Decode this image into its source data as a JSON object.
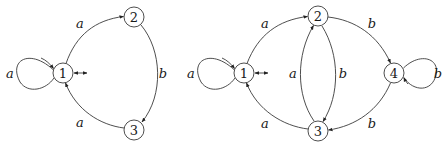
{
  "diagrams": [
    {
      "name": "automaton-left",
      "nodes": [
        {
          "id": "1",
          "label": "1"
        },
        {
          "id": "2",
          "label": "2"
        },
        {
          "id": "3",
          "label": "3"
        }
      ],
      "edges": [
        {
          "from": "1",
          "to": "1",
          "label": "a"
        },
        {
          "from": "1",
          "to": "2",
          "label": "a"
        },
        {
          "from": "2",
          "to": "3",
          "label": "b"
        },
        {
          "from": "3",
          "to": "1",
          "label": "a"
        }
      ],
      "initial_final": "1"
    },
    {
      "name": "automaton-right",
      "nodes": [
        {
          "id": "1",
          "label": "1"
        },
        {
          "id": "2",
          "label": "2"
        },
        {
          "id": "3",
          "label": "3"
        },
        {
          "id": "4",
          "label": "4"
        }
      ],
      "edges": [
        {
          "from": "1",
          "to": "1",
          "label": "a"
        },
        {
          "from": "1",
          "to": "2",
          "label": "a"
        },
        {
          "from": "2",
          "to": "4",
          "label": "b"
        },
        {
          "from": "2",
          "to": "3",
          "label": "b"
        },
        {
          "from": "3",
          "to": "2",
          "label": "a"
        },
        {
          "from": "4",
          "to": "4",
          "label": "b"
        },
        {
          "from": "4",
          "to": "3",
          "label": "b"
        },
        {
          "from": "3",
          "to": "1",
          "label": "a"
        }
      ],
      "initial_final": "1"
    }
  ]
}
